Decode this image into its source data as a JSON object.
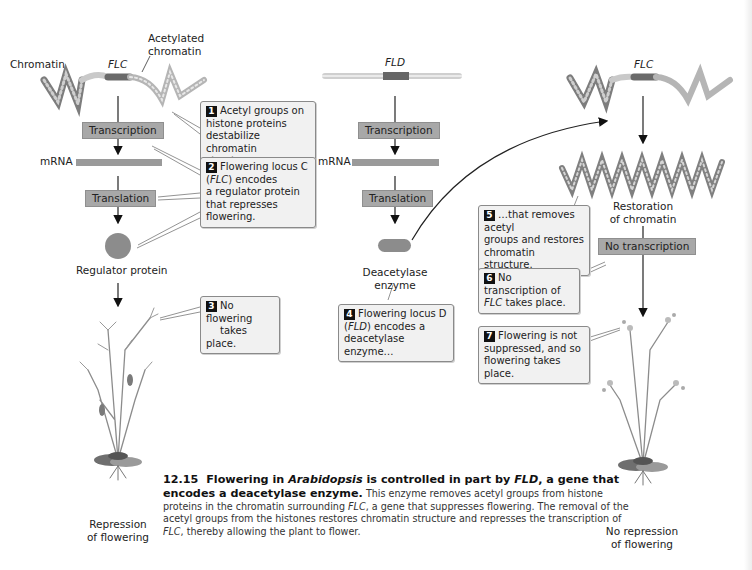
{
  "figure": {
    "left_panel": {
      "chromatin_label": "Chromatin",
      "gene_label": "FLC",
      "acetylated_label_line1": "Acetylated",
      "acetylated_label_line2": "chromatin",
      "transcription_label": "Transcription",
      "mrna_label": "mRNA",
      "translation_label": "Translation",
      "protein_label": "Regulator protein",
      "outcome_line1": "Repression",
      "outcome_line2": "of flowering"
    },
    "middle_panel": {
      "gene_label": "FLD",
      "transcription_label": "Transcription",
      "mrna_label": "mRNA",
      "translation_label": "Translation",
      "enzyme_line1": "Deacetylase",
      "enzyme_line2": "enzyme"
    },
    "right_panel": {
      "gene_label": "FLC",
      "restoration_line1": "Restoration",
      "restoration_line2": "of chromatin",
      "no_transcription_label": "No transcription",
      "outcome_line1": "No repression",
      "outcome_line2": "of flowering"
    },
    "steps": [
      {
        "num": "1",
        "lines": [
          "Acetyl groups on",
          "histone proteins",
          "destabilize chromatin",
          "structure."
        ]
      },
      {
        "num": "2",
        "line1": "Flowering locus C",
        "line2_pre": "(",
        "line2_ital": "FLC",
        "line2_post": ") encodes",
        "line3": "a regulator protein",
        "line4": "that represses",
        "line5": "flowering."
      },
      {
        "num": "3",
        "lines": [
          "No flowering",
          "takes place."
        ]
      },
      {
        "num": "4",
        "line1": "Flowering locus D",
        "line2_pre": "(",
        "line2_ital": "FLD",
        "line2_post": ") encodes a",
        "line3": "deacetylase enzyme…"
      },
      {
        "num": "5",
        "lines": [
          "…that removes acetyl",
          "groups and restores",
          "chromatin structure."
        ]
      },
      {
        "num": "6",
        "line1": "No transcription of",
        "line2_ital": "FLC",
        "line2_post": " takes place."
      },
      {
        "num": "7",
        "lines": [
          "Flowering is not",
          "suppressed, and so",
          "flowering takes place."
        ]
      }
    ],
    "caption": {
      "number": "12.15",
      "title_a": "Flowering in ",
      "title_ital": "Arabidopsis",
      "title_b": " is controlled in part by ",
      "title_ital2": "FLD",
      "title_c": ", a gene that encodes a deacetylase enzyme.",
      "body_a": " This enzyme removes acetyl groups from histone proteins in the chromatin surrounding ",
      "body_ital1": "FLC",
      "body_b": ", a gene that suppresses flowering. The removal of the acetyl groups from the histones restores chromatin structure and represses the transcription of ",
      "body_ital2": "FLC",
      "body_c": ", thereby allowing the plant to flower."
    },
    "colors": {
      "process_box": "#a8a8a8",
      "mrna_bar": "#9a9a9a",
      "protein": "#8c8c8c",
      "step_box_bg": "#f1f1f1",
      "gene_segment": "#666666"
    }
  }
}
